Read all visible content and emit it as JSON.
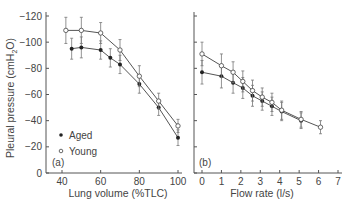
{
  "chart_data": [
    {
      "type": "line",
      "panel_label": "(a)",
      "title": "",
      "xlabel": "Lung volume (%TLC)",
      "ylabel": "Pleural pressure (cmH2O)",
      "xticks": [
        40,
        60,
        80,
        100
      ],
      "yticks": [
        0,
        -20,
        -40,
        -60,
        -80,
        -100,
        -120
      ],
      "xlim": [
        40,
        100
      ],
      "ylim": [
        0,
        -120
      ],
      "grid": false,
      "legend": {
        "position": "lower-left",
        "entries": [
          "Aged",
          "Young"
        ]
      },
      "series": [
        {
          "name": "Aged",
          "marker": "filled-circle",
          "x": [
            45,
            50,
            60,
            65,
            70,
            80,
            90,
            100
          ],
          "y": [
            -95,
            -96,
            -94,
            -88,
            -83,
            -68,
            -50,
            -27
          ],
          "err": [
            8,
            8,
            7,
            7,
            7,
            7,
            6,
            6
          ]
        },
        {
          "name": "Young",
          "marker": "open-circle",
          "x": [
            42,
            50,
            60,
            70,
            80,
            90,
            100
          ],
          "y": [
            -109,
            -109,
            -107,
            -94,
            -74,
            -55,
            -36
          ],
          "err": [
            10,
            10,
            8,
            8,
            8,
            6,
            5
          ]
        }
      ]
    },
    {
      "type": "line",
      "panel_label": "(b)",
      "title": "",
      "xlabel": "Flow rate (l/s)",
      "ylabel": "",
      "xticks": [
        0,
        1,
        2,
        3,
        4,
        5,
        6,
        7
      ],
      "yticks": [
        0,
        -20,
        -40,
        -60,
        -80,
        -100,
        -120
      ],
      "xlim": [
        0,
        7
      ],
      "ylim": [
        0,
        -120
      ],
      "grid": false,
      "series": [
        {
          "name": "Aged",
          "marker": "filled-circle",
          "x": [
            0,
            1,
            1.6,
            2.1,
            2.6,
            3.1,
            3.6,
            4.1,
            5.1
          ],
          "y": [
            -77,
            -74,
            -69,
            -65,
            -59,
            -55,
            -51,
            -47,
            -40
          ],
          "err": [
            9,
            9,
            8,
            8,
            8,
            7,
            7,
            7,
            6
          ]
        },
        {
          "name": "Young",
          "marker": "open-circle",
          "x": [
            0,
            1,
            1.6,
            2.1,
            2.6,
            3.1,
            3.6,
            4.1,
            5.1,
            6.1
          ],
          "y": [
            -91,
            -82,
            -77,
            -70,
            -63,
            -58,
            -54,
            -48,
            -41,
            -35
          ],
          "err": [
            9,
            9,
            8,
            8,
            8,
            7,
            7,
            7,
            6,
            5
          ]
        }
      ]
    }
  ],
  "labels": {
    "ylabel": "Pleural pressure (cmH",
    "ylabel_sub": "2",
    "ylabel_end": "O)",
    "legend_aged": "Aged",
    "legend_young": "Young",
    "panel_a": "(a)",
    "panel_b": "(b)",
    "xlabel_a": "Lung volume (%TLC)",
    "xlabel_b": "Flow rate (l/s)"
  }
}
